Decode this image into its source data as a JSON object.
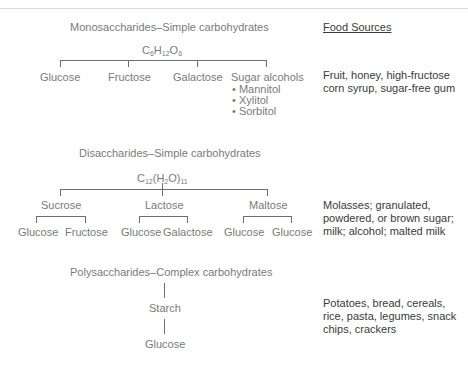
{
  "header": {
    "food_sources_label": "Food Sources"
  },
  "monosaccharides": {
    "title": "Monosaccharides–Simple carbohydrates",
    "formula": {
      "parts": [
        "C",
        "6",
        "H",
        "12",
        "O",
        "6"
      ]
    },
    "items": [
      "Glucose",
      "Fructose",
      "Galactose",
      "Sugar alcohols"
    ],
    "sugar_alcohols": [
      "• Mannitol",
      "• Xylitol",
      "• Sorbitol"
    ],
    "food_sources": [
      "Fruit, honey, high-fructose",
      "corn syrup, sugar-free gum"
    ]
  },
  "disaccharides": {
    "title": "Disaccharides–Simple carbohydrates",
    "formula": {
      "parts": [
        "C",
        "12",
        "(H",
        "2",
        "O)",
        "11"
      ]
    },
    "items": [
      {
        "name": "Sucrose",
        "components": [
          "Glucose",
          "Fructose"
        ]
      },
      {
        "name": "Lactose",
        "components": [
          "Glucose",
          "Galactose"
        ]
      },
      {
        "name": "Maltose",
        "components": [
          "Glucose",
          "Glucose"
        ]
      }
    ],
    "food_sources": [
      "Molasses; granulated,",
      "powdered, or brown sugar;",
      "milk; alcohol; malted milk"
    ]
  },
  "polysaccharides": {
    "title": "Polysaccharides–Complex carbohydrates",
    "items": [
      "Starch",
      "Glucose"
    ],
    "food_sources": [
      "Potatoes, bread, cereals,",
      "rice, pasta, legumes, snack",
      "chips, crackers"
    ]
  }
}
